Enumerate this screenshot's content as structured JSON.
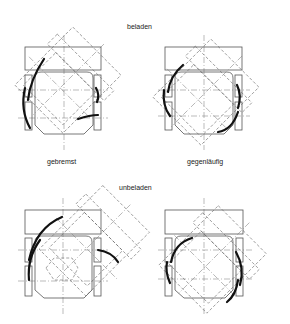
{
  "figure": {
    "labels": {
      "loaded": "beladen",
      "unloaded": "unbeladen",
      "braked": "gebremst",
      "counter_rotating": "gegenläufig"
    },
    "panels": [
      {
        "id": "loaded-braked",
        "row": "beladen",
        "column": "gebremst"
      },
      {
        "id": "loaded-counter",
        "row": "beladen",
        "column": "gegenläufig"
      },
      {
        "id": "unloaded-braked",
        "row": "unbeladen",
        "column": "gebremst"
      },
      {
        "id": "unloaded-counter",
        "row": "unbeladen",
        "column": "gegenläufig"
      }
    ]
  }
}
